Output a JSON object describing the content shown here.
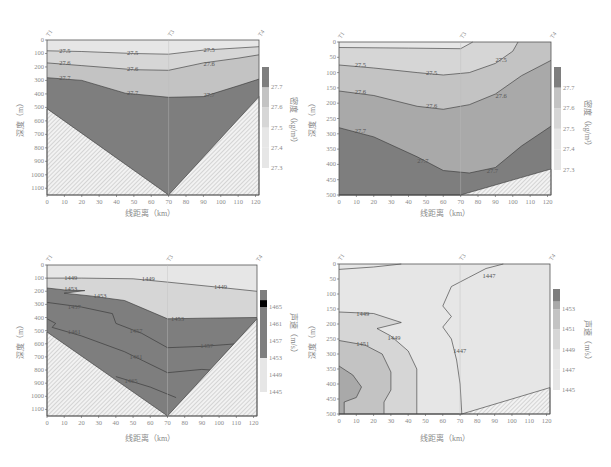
{
  "colors": {
    "c1": "#e6e6e6",
    "c2": "#d6d6d6",
    "c3": "#c3c3c3",
    "c4": "#a9a9a9",
    "c5": "#7e7e7e",
    "line": "#333333",
    "hatch": "#9c9c9c"
  },
  "chart_data": [
    {
      "id": "density_full",
      "type": "heatmap",
      "subtype": "contour_section",
      "title": "",
      "xlabel": "线距离（km）",
      "ylabel": "深度（m）",
      "colorbar_label": "密度（kg/m³）",
      "xlim": [
        0,
        122
      ],
      "ylim": [
        1150,
        0
      ],
      "xticks": [
        0,
        10,
        20,
        30,
        40,
        50,
        60,
        70,
        80,
        90,
        100,
        110,
        120
      ],
      "yticks": [
        0,
        100,
        200,
        300,
        400,
        500,
        600,
        700,
        800,
        900,
        1000,
        1100
      ],
      "stations": [
        {
          "name": "T1",
          "x": 0
        },
        {
          "name": "T3",
          "x": 70
        },
        {
          "name": "T4",
          "x": 122
        }
      ],
      "colorbar_ticks": [
        27.3,
        27.4,
        27.5,
        27.6,
        27.7
      ],
      "contour_levels": [
        27.5,
        27.6,
        27.7
      ],
      "contours": [
        {
          "level": 27.5,
          "points": [
            [
              0,
              80
            ],
            [
              20,
              85
            ],
            [
              50,
              100
            ],
            [
              70,
              105
            ],
            [
              90,
              75
            ],
            [
              122,
              50
            ]
          ],
          "labels": [
            [
              7,
              80
            ],
            [
              46,
              100
            ],
            [
              90,
              75
            ]
          ]
        },
        {
          "level": 27.6,
          "points": [
            [
              0,
              170
            ],
            [
              20,
              190
            ],
            [
              50,
              220
            ],
            [
              70,
              225
            ],
            [
              90,
              170
            ],
            [
              110,
              135
            ],
            [
              122,
              110
            ]
          ],
          "labels": [
            [
              7,
              170
            ],
            [
              46,
              215
            ],
            [
              90,
              175
            ]
          ]
        },
        {
          "level": 27.7,
          "points": [
            [
              0,
              280
            ],
            [
              20,
              300
            ],
            [
              45,
              395
            ],
            [
              70,
              425
            ],
            [
              90,
              420
            ],
            [
              110,
              340
            ],
            [
              122,
              290
            ]
          ],
          "labels": [
            [
              7,
              285
            ],
            [
              46,
              390
            ],
            [
              90,
              410
            ]
          ]
        }
      ],
      "bathymetry": [
        [
          0,
          510
        ],
        [
          70,
          1150
        ],
        [
          122,
          420
        ]
      ]
    },
    {
      "id": "density_upper",
      "type": "heatmap",
      "subtype": "contour_section",
      "xlabel": "线距离（km）",
      "ylabel": "深度（m）",
      "colorbar_label": "密度（kg/m³）",
      "xlim": [
        0,
        122
      ],
      "ylim": [
        500,
        0
      ],
      "xticks": [
        0,
        10,
        20,
        30,
        40,
        50,
        60,
        70,
        80,
        90,
        100,
        110,
        120
      ],
      "yticks": [
        0,
        50,
        100,
        150,
        200,
        250,
        300,
        350,
        400,
        450,
        500
      ],
      "stations": [
        {
          "name": "T1",
          "x": 0
        },
        {
          "name": "T3",
          "x": 70
        },
        {
          "name": "T4",
          "x": 122
        }
      ],
      "colorbar_ticks": [
        27.3,
        27.4,
        27.5,
        27.6,
        27.7
      ],
      "contour_levels": [
        27.4,
        27.5,
        27.6,
        27.7
      ],
      "contours": [
        {
          "level": 27.4,
          "points": [
            [
              0,
              18
            ],
            [
              40,
              20
            ],
            [
              70,
              22
            ],
            [
              77,
              0
            ]
          ],
          "labels": []
        },
        {
          "level": 27.5,
          "points": [
            [
              0,
              75
            ],
            [
              20,
              85
            ],
            [
              45,
              100
            ],
            [
              60,
              108
            ],
            [
              75,
              100
            ],
            [
              90,
              70
            ],
            [
              100,
              30
            ],
            [
              103,
              0
            ]
          ],
          "labels": [
            [
              9,
              75
            ],
            [
              50,
              100
            ],
            [
              90,
              60
            ]
          ]
        },
        {
          "level": 27.6,
          "points": [
            [
              0,
              160
            ],
            [
              20,
              175
            ],
            [
              45,
              210
            ],
            [
              60,
              220
            ],
            [
              75,
              205
            ],
            [
              90,
              170
            ],
            [
              105,
              110
            ],
            [
              122,
              60
            ]
          ],
          "labels": [
            [
              9,
              165
            ],
            [
              50,
              210
            ],
            [
              90,
              175
            ]
          ]
        },
        {
          "level": 27.7,
          "points": [
            [
              0,
              280
            ],
            [
              20,
              310
            ],
            [
              45,
              375
            ],
            [
              60,
              420
            ],
            [
              75,
              428
            ],
            [
              90,
              410
            ],
            [
              105,
              340
            ],
            [
              122,
              275
            ]
          ],
          "labels": [
            [
              9,
              290
            ],
            [
              45,
              390
            ],
            [
              85,
              420
            ]
          ]
        }
      ],
      "bathymetry": [
        [
          0,
          500
        ],
        [
          70,
          500
        ],
        [
          122,
          415
        ]
      ]
    },
    {
      "id": "soundspeed_full",
      "type": "heatmap",
      "subtype": "contour_section",
      "xlabel": "线距离（km）",
      "ylabel": "深度（m）",
      "colorbar_label": "声速（m/s）",
      "xlim": [
        0,
        122
      ],
      "ylim": [
        1150,
        0
      ],
      "xticks": [
        0,
        10,
        20,
        30,
        40,
        50,
        60,
        70,
        80,
        90,
        100,
        110,
        120
      ],
      "yticks": [
        0,
        100,
        200,
        300,
        400,
        500,
        600,
        700,
        800,
        900,
        1000,
        1100
      ],
      "stations": [
        {
          "name": "T1",
          "x": 0
        },
        {
          "name": "T3",
          "x": 70
        },
        {
          "name": "T4",
          "x": 122
        }
      ],
      "colorbar_ticks": [
        1445,
        1449,
        1453,
        1457,
        1461,
        1465
      ],
      "contour_levels": [
        1449,
        1453,
        1457,
        1461,
        1465
      ],
      "contours": [
        {
          "level": 1449,
          "points": [
            [
              0,
              100
            ],
            [
              20,
              100
            ],
            [
              50,
              105
            ],
            [
              70,
              130
            ],
            [
              100,
              170
            ],
            [
              122,
              200
            ]
          ],
          "labels": [
            [
              10,
              100
            ],
            [
              55,
              105
            ],
            [
              97,
              165
            ]
          ]
        },
        {
          "level": 1453,
          "points": [
            [
              0,
              175
            ],
            [
              10,
              190
            ],
            [
              22,
              195
            ],
            [
              10,
              215
            ],
            [
              25,
              235
            ],
            [
              45,
              270
            ],
            [
              70,
              410
            ],
            [
              90,
              405
            ],
            [
              122,
              400
            ]
          ],
          "labels": [
            [
              10,
              180
            ],
            [
              27,
              235
            ],
            [
              72,
              410
            ]
          ]
        },
        {
          "level": 1457,
          "points": [
            [
              0,
              285
            ],
            [
              20,
              320
            ],
            [
              38,
              370
            ],
            [
              40,
              445
            ],
            [
              55,
              520
            ],
            [
              70,
              630
            ],
            [
              90,
              620
            ],
            [
              110,
              600
            ]
          ],
          "labels": [
            [
              12,
              320
            ],
            [
              48,
              500
            ],
            [
              89,
              620
            ]
          ]
        },
        {
          "level": 1461,
          "points": [
            [
              0,
              410
            ],
            [
              5,
              445
            ],
            [
              3,
              475
            ],
            [
              20,
              540
            ],
            [
              45,
              660
            ],
            [
              70,
              820
            ],
            [
              90,
              795
            ],
            [
              95,
              800
            ]
          ],
          "labels": [
            [
              12,
              510
            ],
            [
              48,
              700
            ]
          ]
        },
        {
          "level": 1465,
          "points": [
            [
              40,
              850
            ],
            [
              60,
              930
            ],
            [
              75,
              1010
            ]
          ],
          "labels": [
            [
              45,
              885
            ]
          ]
        }
      ],
      "bathymetry": [
        [
          0,
          510
        ],
        [
          70,
          1150
        ],
        [
          122,
          410
        ]
      ]
    },
    {
      "id": "soundspeed_upper",
      "type": "heatmap",
      "subtype": "contour_section",
      "xlabel": "线距离（km）",
      "ylabel": "深度（m）",
      "colorbar_label": "声速（m/s）",
      "xlim": [
        0,
        122
      ],
      "ylim": [
        500,
        0
      ],
      "xticks": [
        0,
        10,
        20,
        30,
        40,
        50,
        60,
        70,
        80,
        90,
        100,
        110,
        120
      ],
      "yticks": [
        0,
        50,
        100,
        150,
        200,
        250,
        300,
        350,
        400,
        450,
        500
      ],
      "stations": [
        {
          "name": "T1",
          "x": 0
        },
        {
          "name": "T3",
          "x": 70
        },
        {
          "name": "T4",
          "x": 122
        }
      ],
      "colorbar_ticks": [
        1445,
        1447,
        1449,
        1451,
        1453
      ],
      "contour_levels": [
        1447,
        1449,
        1451,
        1453
      ],
      "contours": [
        {
          "level": 1447,
          "points": [
            [
              0,
              18
            ],
            [
              20,
              10
            ],
            [
              36,
              0
            ]
          ],
          "labels": []
        },
        {
          "level": 1447,
          "points": [
            [
              95,
              0
            ],
            [
              85,
              15
            ],
            [
              75,
              45
            ],
            [
              65,
              75
            ],
            [
              60,
              140
            ],
            [
              65,
              175
            ],
            [
              60,
              210
            ],
            [
              65,
              250
            ],
            [
              68,
              320
            ],
            [
              70,
              400
            ],
            [
              71,
              500
            ]
          ],
          "labels": [
            [
              83,
              40
            ],
            [
              66,
              290
            ]
          ]
        },
        {
          "level": 1449,
          "points": [
            [
              0,
              160
            ],
            [
              20,
              165
            ],
            [
              36,
              195
            ],
            [
              22,
              215
            ],
            [
              30,
              240
            ],
            [
              40,
              290
            ],
            [
              45,
              350
            ],
            [
              45,
              400
            ],
            [
              45,
              500
            ]
          ],
          "labels": [
            [
              10,
              165
            ],
            [
              28,
              245
            ]
          ]
        },
        {
          "level": 1451,
          "points": [
            [
              0,
              255
            ],
            [
              15,
              270
            ],
            [
              25,
              300
            ],
            [
              30,
              360
            ],
            [
              30,
              420
            ],
            [
              26,
              460
            ],
            [
              26,
              500
            ]
          ],
          "labels": [
            [
              10,
              265
            ]
          ]
        },
        {
          "level": 1453,
          "points": [
            [
              0,
              340
            ],
            [
              8,
              370
            ],
            [
              13,
              410
            ],
            [
              10,
              445
            ],
            [
              3,
              460
            ],
            [
              3,
              500
            ]
          ],
          "labels": []
        }
      ],
      "bathymetry": [
        [
          0,
          500
        ],
        [
          71,
          500
        ],
        [
          122,
          412
        ]
      ]
    }
  ],
  "panels": [
    {
      "xlabel": "线距离（km）",
      "ylabel": "深度（m）",
      "cblabel": "密度（kg/m³）"
    },
    {
      "xlabel": "线距离（km）",
      "ylabel": "深度（m）",
      "cblabel": "密度（kg/m³）"
    },
    {
      "xlabel": "线距离（km）",
      "ylabel": "深度（m）",
      "cblabel": "声速（m/s）"
    },
    {
      "xlabel": "线距离（km）",
      "ylabel": "深度（m）",
      "cblabel": "声速（m/s）"
    }
  ]
}
